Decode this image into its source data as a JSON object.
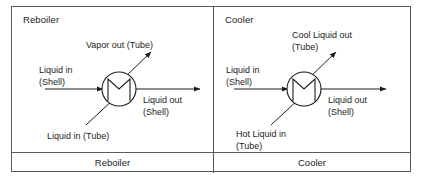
{
  "figure": {
    "type": "process-flow-diagram-table",
    "columns": 2,
    "line_color": "#1c1c1c",
    "frame_color": "#5a5a5a",
    "background": "#ffffff"
  },
  "panels": [
    {
      "id": "reboiler",
      "title": "Reboiler",
      "caption": "Reboiler",
      "symbol": "heat-exchanger-circle-zigzag",
      "streams": [
        {
          "id": "shell-in",
          "label": "Liquid in\n(Shell)",
          "direction": "in",
          "port": "left-horizontal"
        },
        {
          "id": "tube-out",
          "label": "Vapor out (Tube)",
          "direction": "out",
          "port": "upper-right-diagonal"
        },
        {
          "id": "shell-out",
          "label": "Liquid out\n(Shell)",
          "direction": "out",
          "port": "right-horizontal"
        },
        {
          "id": "tube-in",
          "label": "Liquid in (Tube)",
          "direction": "in",
          "port": "lower-left-diagonal"
        }
      ]
    },
    {
      "id": "cooler",
      "title": "Cooler",
      "caption": "Cooler",
      "symbol": "heat-exchanger-circle-zigzag",
      "streams": [
        {
          "id": "shell-in",
          "label": "Liquid in\n(Shell)",
          "direction": "in",
          "port": "left-horizontal"
        },
        {
          "id": "tube-out",
          "label": "Cool Liquid out\n(Tube)",
          "direction": "out",
          "port": "upper-right-diagonal"
        },
        {
          "id": "shell-out",
          "label": "Liquid out\n(Shell)",
          "direction": "out",
          "port": "right-horizontal"
        },
        {
          "id": "tube-in",
          "label": "Hot Liquid in\n(Tube)",
          "direction": "in",
          "port": "lower-left-diagonal"
        }
      ]
    }
  ]
}
